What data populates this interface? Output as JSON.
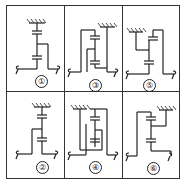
{
  "figure": {
    "cells": [
      {
        "label": "①",
        "row": 0,
        "col": 0
      },
      {
        "label": "③",
        "row": 0,
        "col": 1
      },
      {
        "label": "⑤",
        "row": 0,
        "col": 2
      },
      {
        "label": "②",
        "row": 1,
        "col": 0
      },
      {
        "label": "④",
        "row": 1,
        "col": 1
      },
      {
        "label": "⑥",
        "row": 1,
        "col": 2
      }
    ],
    "colors": {
      "line": "#222222",
      "border": "#333333",
      "background": "#ffffff"
    }
  }
}
